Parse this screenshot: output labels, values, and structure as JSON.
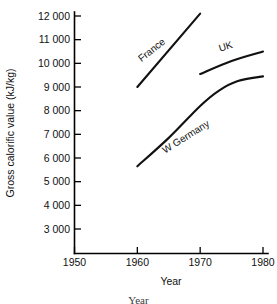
{
  "chart_data": {
    "type": "line",
    "title": "",
    "xlabel": "Year",
    "ylabel": "Gross calorific value (kJ/kg)",
    "xlim": [
      1945,
      1982
    ],
    "ylim": [
      2550,
      12400
    ],
    "grid": false,
    "legend_position": "inline-labels",
    "x_ticks": [
      1950,
      1960,
      1970,
      1980
    ],
    "x_tick_labels": [
      "1950",
      "1960",
      "1970",
      "1980"
    ],
    "y_ticks": [
      3000,
      4000,
      5000,
      6000,
      7000,
      8000,
      9000,
      10000,
      11000,
      12000
    ],
    "y_tick_labels": [
      "3 000",
      "4 000",
      "5 000",
      "6 000",
      "7 000",
      "8 000",
      "9 000",
      "10 000",
      "11 000",
      "12 000"
    ],
    "series": [
      {
        "name": "France",
        "label": "France",
        "label_rotation": -38,
        "label_x": 1962.6,
        "label_y": 10450,
        "x": [
          1960,
          1970
        ],
        "y": [
          9000,
          12100
        ]
      },
      {
        "name": "UK",
        "label": "UK",
        "label_rotation": -17,
        "label_x": 1974.2,
        "label_y": 10580,
        "x": [
          1970,
          1975,
          1980
        ],
        "y": [
          9550,
          10100,
          10500
        ]
      },
      {
        "name": "W Germany",
        "label": "W Germany",
        "label_rotation": -32,
        "label_x": 1968.0,
        "label_y": 6780,
        "x": [
          1960,
          1965,
          1970,
          1973,
          1976,
          1980
        ],
        "y": [
          5650,
          6850,
          8200,
          8850,
          9250,
          9450
        ]
      }
    ]
  },
  "caption": {
    "text": "Year"
  }
}
